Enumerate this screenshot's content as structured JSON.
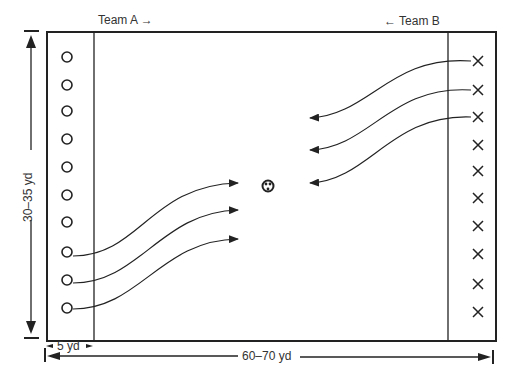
{
  "labels": {
    "team_a": "Team A →",
    "team_b": "← Team B",
    "width_dim": "30–35 yd",
    "zone_dim": "5 yd",
    "length_dim": "60–70 yd"
  },
  "team_a": {
    "symbol": "circle",
    "count": 10
  },
  "team_b": {
    "symbol": "cross",
    "count": 10
  },
  "ball": {
    "symbol": "ball-icon"
  },
  "colors": {
    "ink": "#222222",
    "background": "#ffffff"
  }
}
